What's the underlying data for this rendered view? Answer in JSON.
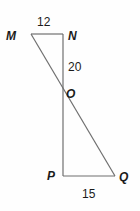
{
  "figure": {
    "type": "geometry-diagram",
    "background_color": "#fefefe",
    "stroke_color": "#6f6f6f",
    "text_color": "#1b1b1b",
    "vertices": [
      {
        "name": "M",
        "label": "M",
        "x": 31,
        "y": 34
      },
      {
        "name": "N",
        "label": "N",
        "x": 63,
        "y": 34
      },
      {
        "name": "O",
        "label": "O",
        "x": 62,
        "y": 92
      },
      {
        "name": "P",
        "label": "P",
        "x": 63,
        "y": 176
      },
      {
        "name": "Q",
        "label": "Q",
        "x": 115,
        "y": 176
      }
    ],
    "segments": [
      {
        "name": "segment-MN",
        "from": "M",
        "to": "N"
      },
      {
        "name": "segment-NP",
        "from": "N",
        "to": "P"
      },
      {
        "name": "segment-PQ",
        "from": "P",
        "to": "Q"
      },
      {
        "name": "segment-MQ",
        "from": "M",
        "to": "Q"
      }
    ],
    "measures": {
      "MN": "12",
      "NO": "20",
      "PQ": "15"
    }
  }
}
